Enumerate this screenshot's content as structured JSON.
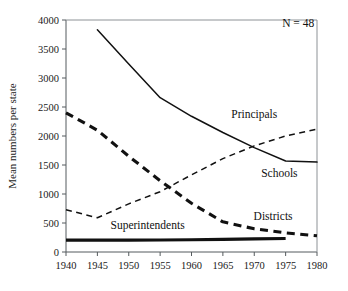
{
  "chart_data": {
    "type": "line",
    "title": "",
    "xlabel": "",
    "ylabel": "Mean numbers per state",
    "xlim": [
      1940,
      1980
    ],
    "ylim": [
      0,
      4000
    ],
    "grid": false,
    "legend_position": "inline-right",
    "x_ticks": [
      1940,
      1945,
      1950,
      1955,
      1960,
      1965,
      1970,
      1975,
      1980
    ],
    "y_ticks": [
      0,
      500,
      1000,
      1500,
      2000,
      2500,
      3000,
      3500,
      4000
    ],
    "annotations": [
      {
        "text": "N = 48",
        "x": 1977,
        "y": 3880
      }
    ],
    "series": [
      {
        "name": "Schools",
        "style": "solid-thin",
        "label_x": 1974,
        "label_y": 1300,
        "x": [
          1945,
          1950,
          1955,
          1960,
          1965,
          1970,
          1975,
          1980
        ],
        "values": [
          3830,
          3240,
          2660,
          2340,
          2060,
          1800,
          1570,
          1550
        ]
      },
      {
        "name": "Districts",
        "style": "dashed-thick",
        "label_x": 1973,
        "label_y": 560,
        "x": [
          1940,
          1945,
          1950,
          1955,
          1960,
          1965,
          1970,
          1975,
          1980
        ],
        "values": [
          2400,
          2100,
          1650,
          1230,
          840,
          520,
          400,
          330,
          280
        ]
      },
      {
        "name": "Principals",
        "style": "dashed-thin",
        "label_x": 1970,
        "label_y": 2310,
        "x": [
          1940,
          1945,
          1950,
          1955,
          1960,
          1965,
          1970,
          1975,
          1980
        ],
        "values": [
          730,
          590,
          830,
          1040,
          1330,
          1610,
          1830,
          2000,
          2120
        ]
      },
      {
        "name": "Superintendents",
        "style": "solid-thick",
        "label_x": 1953,
        "label_y": 400,
        "x": [
          1940,
          1945,
          1950,
          1955,
          1960,
          1965,
          1970,
          1975
        ],
        "values": [
          205,
          205,
          205,
          208,
          212,
          218,
          226,
          232
        ]
      }
    ]
  }
}
